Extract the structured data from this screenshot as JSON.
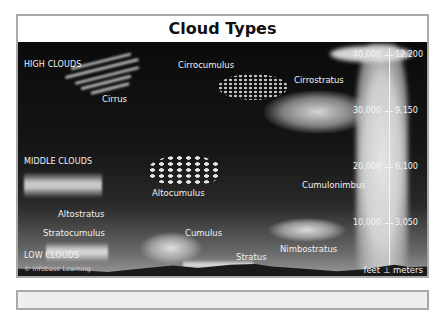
{
  "title": "Cloud Types",
  "categories": {
    "high": "HIGH CLOUDS",
    "middle": "MIDDLE CLOUDS",
    "low": "LOW CLOUDS"
  },
  "clouds": {
    "cirrus": "Cirrus",
    "cirrocumulus": "Cirrocumulus",
    "cirrostratus": "Cirrostratus",
    "altostratus": "Altostratus",
    "altocumulus": "Altocumulus",
    "cumulonimbus": "Cumulonimbus",
    "stratocumulus": "Stratocumulus",
    "cumulus": "Cumulus",
    "nimbostratus": "Nimbostratus",
    "stratus": "Stratus"
  },
  "altitude_scale": {
    "feet": [
      "40,000",
      "30,000",
      "20,000",
      "10,000"
    ],
    "meters": [
      "12,200",
      "9,150",
      "6,100",
      "3,050"
    ],
    "feet_label": "feet",
    "meters_label": "meters"
  },
  "copyright": "© Infobase Learning"
}
